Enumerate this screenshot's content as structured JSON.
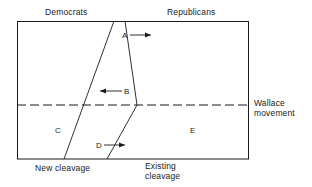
{
  "figure": {
    "type": "diagram",
    "headers": {
      "left": "Democrats",
      "right": "Republicans"
    },
    "regions": [
      {
        "id": "A",
        "label": "A"
      },
      {
        "id": "B",
        "label": "B"
      },
      {
        "id": "C",
        "label": "C"
      },
      {
        "id": "D",
        "label": "D"
      },
      {
        "id": "E",
        "label": "E"
      }
    ],
    "arrows": [
      {
        "region": "A",
        "direction": "right"
      },
      {
        "region": "B",
        "direction": "left"
      },
      {
        "region": "D",
        "direction": "right"
      }
    ],
    "footers": {
      "new_cleavage": "New cleavage",
      "existing_cleavage_line1": "Existing",
      "existing_cleavage_line2": "cleavage"
    },
    "side": {
      "wallace_line1": "Wallace",
      "wallace_line2": "movement"
    },
    "colors": {
      "stroke": "#1a1a1a",
      "background": "#ffffff",
      "text": "#1a1a1a"
    }
  }
}
